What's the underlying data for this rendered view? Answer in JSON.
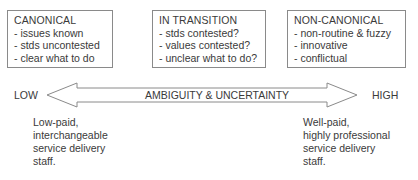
{
  "boxes": [
    {
      "title": "CANONICAL",
      "items": [
        "- issues known",
        "- stds uncontested",
        "- clear what to do"
      ]
    },
    {
      "title": "IN TRANSITION",
      "items": [
        "- stds contested?",
        "- values contested?",
        "- unclear what to do?"
      ]
    },
    {
      "title": "NON-CANONICAL",
      "items": [
        "- non-routine & fuzzy",
        "- innovative",
        "- conflictual"
      ]
    }
  ],
  "axis": {
    "low_label": "LOW",
    "high_label": "HIGH",
    "arrow_label": "AMBIGUITY & UNCERTAINTY"
  },
  "notes": {
    "low": [
      "Low-paid,",
      "interchangeable",
      "service delivery",
      "staff."
    ],
    "high": [
      "Well-paid,",
      "highly professional",
      "service delivery",
      "staff."
    ]
  },
  "colors": {
    "stroke": "#8a8a8a",
    "text": "#3a3a3a"
  }
}
